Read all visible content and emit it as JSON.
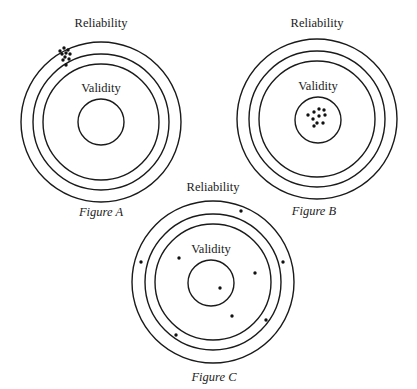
{
  "figures": [
    {
      "id": "A",
      "caption": "Figure A",
      "outer_label": "Reliability",
      "inner_label": "Validity",
      "center": [
        101,
        122
      ],
      "radii": {
        "outer": 80,
        "middle": 68,
        "inner": 58,
        "validity": 23
      },
      "validity_center": [
        101,
        122
      ],
      "label_pos": {
        "reliability": [
          101,
          27
        ],
        "validity": [
          101,
          92
        ],
        "caption": [
          101,
          216
        ]
      },
      "dots": [
        [
          60,
          51
        ],
        [
          64,
          48
        ],
        [
          68,
          50
        ],
        [
          62,
          54
        ],
        [
          66,
          53
        ],
        [
          70,
          54
        ],
        [
          65,
          57
        ],
        [
          69,
          59
        ],
        [
          63,
          60
        ],
        [
          66,
          65
        ]
      ]
    },
    {
      "id": "B",
      "caption": "Figure B",
      "outer_label": "Reliability",
      "inner_label": "Validity",
      "center": [
        317,
        119
      ],
      "radii": {
        "outer": 80,
        "middle": 68,
        "inner": 58,
        "validity": 23
      },
      "validity_center": [
        318,
        120
      ],
      "label_pos": {
        "reliability": [
          317,
          27
        ],
        "validity": [
          318,
          90
        ],
        "caption": [
          314,
          215
        ]
      },
      "dots": [
        [
          319,
          109
        ],
        [
          324,
          110
        ],
        [
          314,
          112
        ],
        [
          308,
          115
        ],
        [
          319,
          116
        ],
        [
          325,
          115
        ],
        [
          313,
          119
        ],
        [
          317,
          123
        ],
        [
          323,
          123
        ],
        [
          314,
          126
        ]
      ]
    },
    {
      "id": "C",
      "caption": "Figure C",
      "outer_label": "Reliability",
      "inner_label": "Validity",
      "center": [
        213,
        282
      ],
      "radii": {
        "outer": 81,
        "middle": 68,
        "inner": 58,
        "validity": 23
      },
      "validity_center": [
        211,
        283
      ],
      "label_pos": {
        "reliability": [
          213,
          191
        ],
        "validity": [
          211,
          253
        ],
        "caption": [
          214,
          381
        ]
      },
      "dots": [
        [
          241,
          211
        ],
        [
          141,
          262
        ],
        [
          179,
          258
        ],
        [
          283,
          262
        ],
        [
          255,
          273
        ],
        [
          220,
          288
        ],
        [
          232,
          316
        ],
        [
          266,
          320
        ],
        [
          176,
          335
        ]
      ]
    }
  ]
}
